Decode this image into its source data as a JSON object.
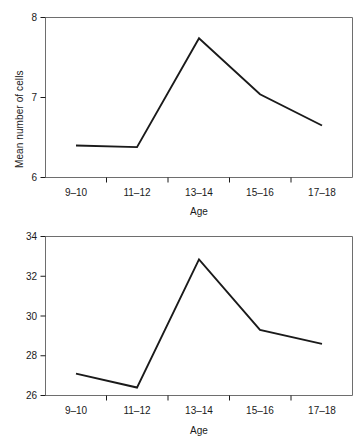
{
  "chart_data": [
    {
      "id": "cells",
      "type": "line",
      "title": "",
      "xlabel": "Age",
      "ylabel": "Mean number of cells",
      "categories": [
        "9–10",
        "11–12",
        "13–14",
        "15–16",
        "17–18"
      ],
      "values": [
        6.4,
        6.38,
        7.74,
        7.04,
        6.65
      ],
      "ylim": [
        6,
        8
      ],
      "yticks": [
        6,
        7,
        8
      ],
      "ytick_labels": [
        "6",
        "7",
        "8"
      ],
      "grid": false,
      "legend": "none",
      "line_color": "#1a1a1a"
    },
    {
      "id": "transitions",
      "type": "line",
      "title": "",
      "xlabel": "Age",
      "ylabel": "Mean number of transitions",
      "categories": [
        "9–10",
        "11–12",
        "13–14",
        "15–16",
        "17–18"
      ],
      "values": [
        27.1,
        26.4,
        32.85,
        29.3,
        28.6
      ],
      "ylim": [
        26,
        34
      ],
      "yticks": [
        26,
        28,
        30,
        32,
        34
      ],
      "ytick_labels": [
        "26",
        "28",
        "30",
        "32",
        "34"
      ],
      "grid": false,
      "legend": "none",
      "line_color": "#1a1a1a"
    }
  ],
  "figures": {
    "cells": {
      "ylabel": "Mean number of cells",
      "xlabel": "Age",
      "ytick_labels": [
        "8",
        "7",
        "6"
      ],
      "xtick_labels": [
        "9–10",
        "11–12",
        "13–14",
        "15–16",
        "17–18"
      ]
    },
    "transitions": {
      "ylabel": "Mean number of transitions",
      "xlabel": "Age",
      "ytick_labels": [
        "34",
        "32",
        "30",
        "28",
        "26"
      ],
      "xtick_labels": [
        "9–10",
        "11–12",
        "13–14",
        "15–16",
        "17–18"
      ]
    }
  }
}
